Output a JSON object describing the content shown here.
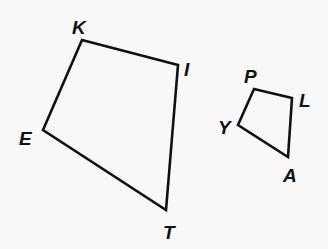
{
  "figure": {
    "background": "#f8f8f8",
    "stroke_color": "#111111",
    "quadrilaterals": [
      {
        "name": "KITE",
        "vertices": [
          {
            "label": "K",
            "x": 82,
            "y": 40,
            "lx": 72,
            "ly": 34
          },
          {
            "label": "I",
            "x": 178,
            "y": 65,
            "lx": 184,
            "ly": 76
          },
          {
            "label": "T",
            "x": 166,
            "y": 210,
            "lx": 163,
            "ly": 239
          },
          {
            "label": "E",
            "x": 43,
            "y": 130,
            "lx": 19,
            "ly": 145
          }
        ]
      },
      {
        "name": "PLAY",
        "vertices": [
          {
            "label": "P",
            "x": 254,
            "y": 89,
            "lx": 244,
            "ly": 83
          },
          {
            "label": "L",
            "x": 292,
            "y": 98,
            "lx": 299,
            "ly": 107
          },
          {
            "label": "A",
            "x": 288,
            "y": 157,
            "lx": 283,
            "ly": 182
          },
          {
            "label": "Y",
            "x": 238,
            "y": 125,
            "lx": 218,
            "ly": 134
          }
        ]
      }
    ]
  }
}
